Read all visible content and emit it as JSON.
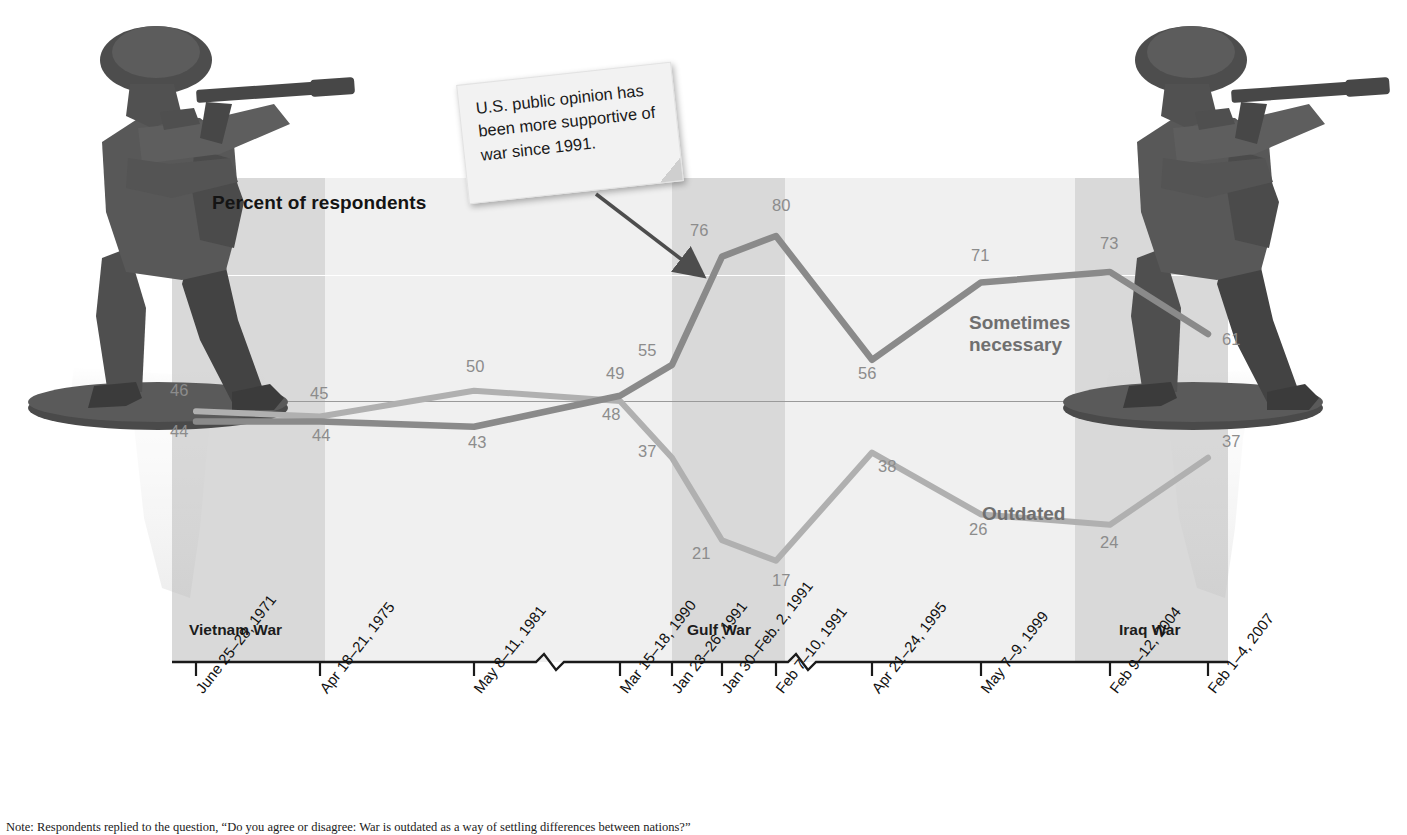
{
  "chart": {
    "axis_title": "Percent of respondents",
    "callout_note": "U.S. public opinion has been more supportive of war since 1991.",
    "series_label_sometimes": "Sometimes\nnecessary",
    "series_label_outdated": "Outdated",
    "war_bands": [
      {
        "label": "Vietnam War"
      },
      {
        "label": "Gulf War"
      },
      {
        "label": "Iraq War"
      }
    ],
    "footnote": "Note: Respondents replied to the question, “Do you agree or disagree: War is outdated as a way of settling differences between nations?”"
  },
  "chart_data": {
    "type": "line",
    "title": "Percent of respondents",
    "xlabel": "",
    "ylabel": "Percent of respondents",
    "ylim": [
      0,
      100
    ],
    "grid": true,
    "legend_position": "inline-right",
    "categories": [
      "June 25–28, 1971",
      "Apr 18–21, 1975",
      "May 8–11, 1981",
      "Mar 15–18, 1990",
      "Jan 23–26, 1991",
      "Jan 30–Feb. 2, 1991",
      "Feb 7–10, 1991",
      "Apr 21–24, 1995",
      "May 7–9, 1999",
      "Feb 9–12, 2004",
      "Feb 1–4, 2007"
    ],
    "series": [
      {
        "name": "Sometimes necessary",
        "color": "#8a8a8a",
        "values": [
          44,
          44,
          43,
          49,
          55,
          76,
          80,
          56,
          71,
          73,
          61
        ]
      },
      {
        "name": "Outdated",
        "color": "#b0b0b0",
        "values": [
          46,
          45,
          50,
          48,
          37,
          21,
          17,
          38,
          26,
          24,
          37
        ]
      }
    ],
    "annotations": [
      {
        "text": "U.S. public opinion has been more supportive of war since 1991.",
        "points_to": "Jan 30–Feb. 2, 1991"
      }
    ],
    "shaded_regions": [
      {
        "label": "Vietnam War",
        "from": "June 25–28, 1971",
        "to": "Apr 18–21, 1975"
      },
      {
        "label": "Gulf War",
        "from": "Jan 23–26, 1991",
        "to": "Feb 7–10, 1991"
      },
      {
        "label": "Iraq War",
        "from": "Feb 9–12, 2004",
        "to": "Feb 1–4, 2007"
      }
    ]
  },
  "value_labels": {
    "sometimes": [
      "44",
      "44",
      "43",
      "49",
      "55",
      "76",
      "80",
      "56",
      "71",
      "73",
      "61"
    ],
    "outdated": [
      "46",
      "45",
      "50",
      "48",
      "37",
      "21",
      "17",
      "38",
      "26",
      "24",
      "37"
    ]
  }
}
